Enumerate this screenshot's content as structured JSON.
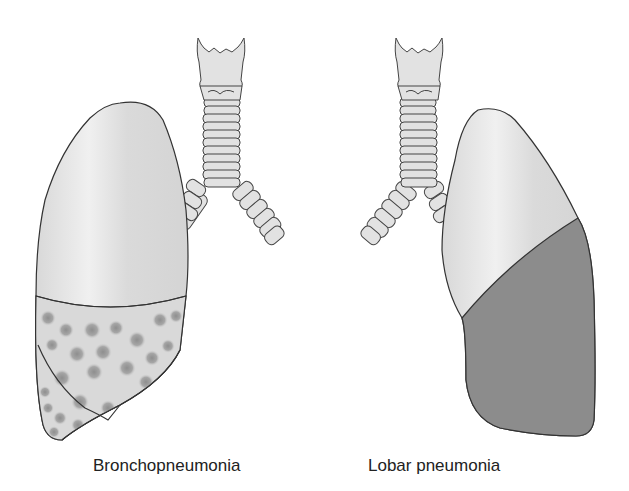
{
  "diagram": {
    "type": "anatomical-illustration",
    "panels": [
      {
        "label": "Bronchopneumonia",
        "structures": [
          "trachea",
          "larynx",
          "bronchi",
          "right lung"
        ],
        "pattern": "patchy spotted consolidation in lower lobes"
      },
      {
        "label": "Lobar pneumonia",
        "structures": [
          "trachea",
          "larynx",
          "bronchi",
          "left lung"
        ],
        "pattern": "uniform consolidation of entire lower lobe"
      }
    ],
    "colors": {
      "healthy_lung": "#dcdcdc",
      "consolidated_lobe": "#8a8a8a",
      "spot": "#9a9a9a",
      "outline": "#333333",
      "trachea": "#e2e2e2"
    }
  }
}
